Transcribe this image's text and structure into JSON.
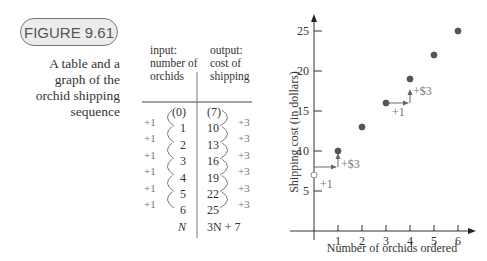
{
  "figure": {
    "label": "FIGURE 9.61",
    "caption": "A table and a graph of the orchid shipping sequence"
  },
  "table": {
    "headers": {
      "input": [
        "input:",
        "number of",
        "orchids"
      ],
      "output": [
        "output:",
        "cost of",
        "shipping"
      ]
    },
    "rows": [
      {
        "input": "(0)",
        "output": "(7)"
      },
      {
        "input": "1",
        "output": "10"
      },
      {
        "input": "2",
        "output": "13"
      },
      {
        "input": "3",
        "output": "16"
      },
      {
        "input": "4",
        "output": "19"
      },
      {
        "input": "5",
        "output": "22"
      },
      {
        "input": "6",
        "output": "25"
      },
      {
        "input": "N",
        "output": "3N + 7"
      }
    ],
    "input_step": "+1",
    "output_step": "+3"
  },
  "chart_data": {
    "type": "scatter",
    "title": "",
    "xlabel": "Number of orchids ordered",
    "ylabel": "Shipping cost (in dollars)",
    "x": [
      0,
      1,
      2,
      3,
      4,
      5,
      6
    ],
    "values": [
      7,
      10,
      13,
      16,
      19,
      22,
      25
    ],
    "open_points": [
      0
    ],
    "xticks": [
      "1",
      "2",
      "3",
      "4",
      "5",
      "6"
    ],
    "yticks": [
      "5",
      "10",
      "15",
      "20",
      "25"
    ],
    "xlim": [
      0,
      6.5
    ],
    "ylim": [
      0,
      27
    ],
    "annotations": [
      {
        "text": "+1",
        "near": "x 0→1"
      },
      {
        "text": "+$3",
        "near": "y 7→10"
      },
      {
        "text": "+1",
        "near": "x 3→4"
      },
      {
        "text": "+$3",
        "near": "y 16→19"
      }
    ],
    "grid": false
  }
}
